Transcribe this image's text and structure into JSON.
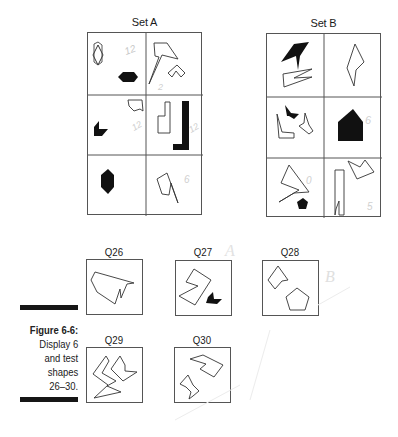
{
  "figure": {
    "sets": [
      {
        "title": "Set A",
        "cells": [
          {
            "row": 1,
            "col": 1,
            "shapes": [
              "outline hexagon (vertical)",
              "filled black hexagon (horizontal)"
            ],
            "annotation": "12"
          },
          {
            "row": 1,
            "col": 2,
            "shapes": [
              "outline arrow-like polygon",
              "outline small chevron polygon"
            ],
            "annotation": "2"
          },
          {
            "row": 2,
            "col": 1,
            "shapes": [
              "outline small irregular polygon",
              "filled black L/chevron polygon"
            ],
            "annotation": "12"
          },
          {
            "row": 2,
            "col": 2,
            "shapes": [
              "outline L-shape",
              "filled black tall L-shape"
            ],
            "annotation": "12"
          },
          {
            "row": 3,
            "col": 1,
            "shapes": [
              "filled black hexagon (vertical)"
            ],
            "annotation": ""
          },
          {
            "row": 3,
            "col": 2,
            "shapes": [
              "outline notched polygon"
            ],
            "annotation": "6"
          }
        ]
      },
      {
        "title": "Set B",
        "cells": [
          {
            "row": 1,
            "col": 1,
            "shapes": [
              "filled black arrowhead polygon",
              "outline zigzag polygon"
            ],
            "annotation": ""
          },
          {
            "row": 1,
            "col": 2,
            "shapes": [
              "outline kite/diamond"
            ],
            "annotation": ""
          },
          {
            "row": 2,
            "col": 1,
            "shapes": [
              "filled black chevron",
              "outline L polygon",
              "outline small notched polygon"
            ],
            "annotation": ""
          },
          {
            "row": 2,
            "col": 2,
            "shapes": [
              "filled black house pentagon"
            ],
            "annotation": "6"
          },
          {
            "row": 3,
            "col": 1,
            "shapes": [
              "outline large arrow polygon",
              "filled black pentagon"
            ],
            "annotation": "0"
          },
          {
            "row": 3,
            "col": 2,
            "shapes": [
              "outline notched rectangle",
              "outline chevron polygon"
            ],
            "annotation": "5"
          }
        ]
      }
    ],
    "questions": [
      {
        "label": "Q26",
        "shapes": [
          "outline irregular notched polygon"
        ]
      },
      {
        "label": "Q27",
        "shapes": [
          "outline zigzag polygon",
          "filled black chevron"
        ]
      },
      {
        "label": "Q28",
        "shapes": [
          "outline notched diamond",
          "outline pentagon"
        ]
      },
      {
        "label": "Q29",
        "shapes": [
          "outline zigzag chevron",
          "outline arrow chevron"
        ]
      },
      {
        "label": "Q30",
        "shapes": [
          "outline notched parallelogram",
          "outline zigzag arrow"
        ]
      }
    ],
    "caption": {
      "title": "Figure 6-6:",
      "line1": "Display 6",
      "line2": "and test",
      "line3": "shapes",
      "line4": "26–30."
    },
    "handwritten_marks": [
      "A",
      "B"
    ]
  }
}
